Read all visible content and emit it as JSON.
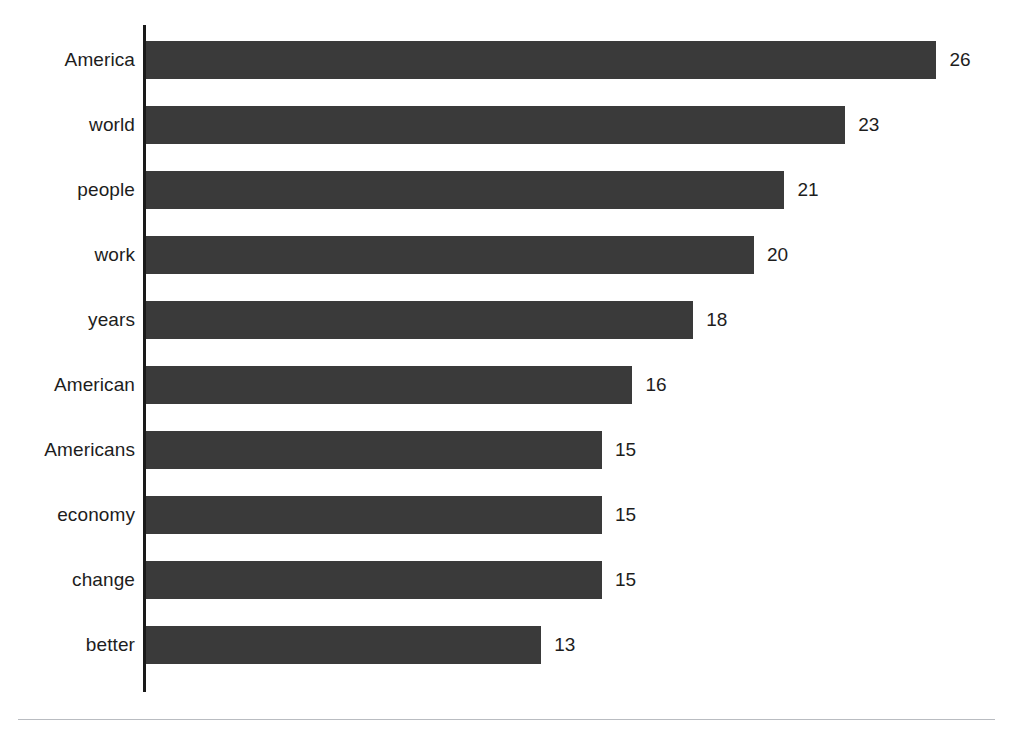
{
  "chart_data": {
    "type": "bar",
    "orientation": "horizontal",
    "title": "",
    "subtitle": "",
    "xlabel": "",
    "ylabel": "",
    "categories": [
      "America",
      "world",
      "people",
      "work",
      "years",
      "American",
      "Americans",
      "economy",
      "change",
      "better"
    ],
    "values": [
      26,
      23,
      21,
      20,
      18,
      16,
      15,
      15,
      15,
      13
    ],
    "value_labels": [
      "26",
      "23",
      "21",
      "20",
      "18",
      "16",
      "15",
      "15",
      "15",
      "13"
    ],
    "series": [
      {
        "name": "frequency",
        "values": [
          26,
          23,
          21,
          20,
          18,
          16,
          15,
          15,
          15,
          13
        ]
      }
    ],
    "xlim": [
      0,
      26
    ],
    "ylim": null,
    "grid": false,
    "legend": false,
    "legend_position": "none",
    "data_labels": true,
    "data_label_position": "outside-end",
    "sorted": "descending",
    "axis_ticks": [],
    "tick_labels": [],
    "annotations": []
  },
  "style": {
    "background_color": "#ffffff",
    "bar_color": "#3a3a3a",
    "axis_color": "#1a1a1a",
    "text_color": "#1d1d1d",
    "rule_color": "#b9bcc1"
  },
  "layout": {
    "axis_x": 144,
    "axis_top": 25,
    "axis_bottom": 692,
    "bar_pitch": 65,
    "bar_height": 38,
    "px_per_unit": 30.4,
    "first_row_top": 27
  }
}
